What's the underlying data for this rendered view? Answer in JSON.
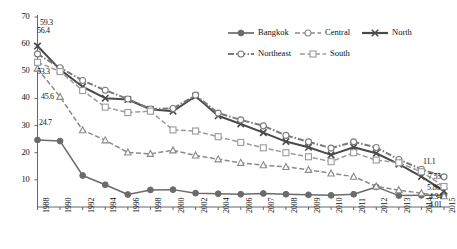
{
  "chart_data": {
    "type": "line",
    "title": "",
    "xlabel": "",
    "ylabel": "",
    "ylim": [
      0,
      70
    ],
    "ytick_values": [
      0,
      10,
      20,
      30,
      40,
      50,
      60,
      70
    ],
    "ytick_labels": [
      "",
      "10",
      "20",
      "30",
      "40",
      "50",
      "60",
      "70"
    ],
    "grid": false,
    "legend_position": "top-right",
    "categories": [
      "1988",
      "1990",
      "1992",
      "1994",
      "1996",
      "1998",
      "2000",
      "2002",
      "2004",
      "2006",
      "2007",
      "2008",
      "2009",
      "2010",
      "2011",
      "2012",
      "2013",
      "2014",
      "2015"
    ],
    "series": [
      {
        "name": "Bangkok",
        "marker": "filled-circle",
        "line": "solid",
        "color": "#6b6b6b",
        "values": [
          24.7,
          24.3,
          11.6,
          8.2,
          4.6,
          6.3,
          6.4,
          5.1,
          4.9,
          4.7,
          5.0,
          4.7,
          4.5,
          4.3,
          4.7,
          7.4,
          4.2,
          4.3,
          4.34
        ]
      },
      {
        "name": "Central",
        "marker": "open-triangle",
        "line": "dashed",
        "color": "#8a8a8a",
        "values": [
          51.0,
          40.6,
          28.3,
          24.6,
          20.1,
          19.6,
          20.9,
          19.0,
          17.6,
          16.3,
          15.4,
          14.8,
          13.7,
          12.4,
          11.2,
          7.6,
          6.2,
          5.1,
          4.01
        ]
      },
      {
        "name": "North",
        "marker": "x-cross",
        "line": "solid",
        "color": "#4a4a4a",
        "values": [
          59.3,
          50.6,
          44.3,
          40.1,
          39.6,
          36.0,
          35.3,
          40.8,
          33.6,
          30.6,
          27.4,
          24.1,
          22.0,
          19.2,
          22.0,
          19.8,
          15.8,
          11.2,
          5.86
        ]
      },
      {
        "name": "Northeast",
        "marker": "open-circle",
        "line": "dash-dot",
        "color": "#7a7a7a",
        "values": [
          56.4,
          51.3,
          46.6,
          43.0,
          39.8,
          36.1,
          36.3,
          41.2,
          34.6,
          32.1,
          29.9,
          26.4,
          24.0,
          21.7,
          24.0,
          21.9,
          17.5,
          13.9,
          11.1
        ]
      },
      {
        "name": "South",
        "marker": "open-square",
        "line": "dashed",
        "color": "#9a9a9a",
        "values": [
          53.3,
          49.9,
          42.9,
          36.8,
          34.8,
          35.3,
          28.4,
          28.0,
          25.9,
          23.8,
          21.8,
          20.0,
          18.5,
          16.7,
          20.0,
          17.3,
          16.3,
          13.0,
          7.55
        ]
      }
    ],
    "point_labels_left": [
      {
        "text": "59.3",
        "series": "North",
        "value": 59.3
      },
      {
        "text": "56.4",
        "series": "Northeast",
        "value": 56.4
      },
      {
        "text": "53.3",
        "series": "South",
        "value": 53.3
      },
      {
        "text": "45.6",
        "series": "Central",
        "value": 45.6
      },
      {
        "text": "24.7",
        "series": "Bangkok",
        "value": 24.7
      }
    ],
    "point_labels_right": [
      {
        "text": "11.1",
        "series": "Northeast",
        "value": 11.1
      },
      {
        "text": "7.55",
        "series": "South",
        "value": 7.55
      },
      {
        "text": "5.86",
        "series": "North",
        "value": 5.86
      },
      {
        "text": "4.34",
        "series": "Bangkok",
        "value": 4.34
      },
      {
        "text": "4.01",
        "series": "Central",
        "value": 4.01
      }
    ],
    "legend_entries": [
      {
        "label": "Bangkok",
        "marker": "filled-circle",
        "line": "solid"
      },
      {
        "label": "Central",
        "marker": "open-circle",
        "line": "dashed"
      },
      {
        "label": "North",
        "marker": "x-cross",
        "line": "solid"
      },
      {
        "label": "Northeast",
        "marker": "open-circle",
        "line": "dash-dot"
      },
      {
        "label": "South",
        "marker": "open-square",
        "line": "dashed"
      }
    ]
  }
}
